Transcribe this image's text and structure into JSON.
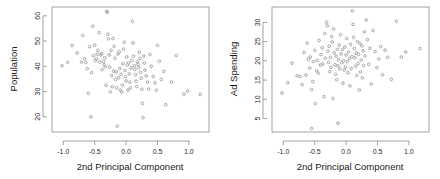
{
  "figure": {
    "width": 440,
    "height": 179,
    "background": "#ffffff",
    "point_color": "#9a9a9a",
    "axis_color": "#8a8a8a",
    "text_color": "#1a1a1a"
  },
  "chart_data": [
    {
      "type": "scatter",
      "title": "",
      "xlabel": "2nd Principal Component",
      "ylabel": "Population",
      "xlim": [
        -1.18,
        1.32
      ],
      "ylim": [
        14.0,
        63.5
      ],
      "xticks": [
        -1.0,
        -0.5,
        0.0,
        0.5,
        1.0
      ],
      "xticklabels": [
        "-1.0",
        "-0.5",
        "0.0",
        "0.5",
        "1.0"
      ],
      "yticks": [
        20,
        30,
        40,
        50,
        60
      ],
      "yticklabels": [
        "20",
        "30",
        "40",
        "50",
        "60"
      ],
      "grid": false,
      "legend": "none",
      "marker": "open-circle",
      "x": [
        -1.02,
        -0.93,
        -0.86,
        -0.78,
        -0.71,
        -0.69,
        -0.66,
        -0.64,
        -0.62,
        -0.6,
        -0.58,
        -0.56,
        -0.55,
        -0.53,
        -0.52,
        -0.5,
        -0.49,
        -0.47,
        -0.46,
        -0.45,
        -0.43,
        -0.42,
        -0.4,
        -0.39,
        -0.38,
        -0.36,
        -0.35,
        -0.34,
        -0.33,
        -0.32,
        -0.31,
        -0.3,
        -0.29,
        -0.28,
        -0.27,
        -0.26,
        -0.25,
        -0.24,
        -0.23,
        -0.22,
        -0.21,
        -0.2,
        -0.19,
        -0.18,
        -0.17,
        -0.16,
        -0.15,
        -0.14,
        -0.13,
        -0.12,
        -0.11,
        -0.1,
        -0.09,
        -0.08,
        -0.07,
        -0.06,
        -0.05,
        -0.04,
        -0.03,
        -0.02,
        -0.01,
        0.0,
        0.01,
        0.02,
        0.03,
        0.04,
        0.05,
        0.06,
        0.07,
        0.08,
        0.09,
        0.1,
        0.11,
        0.12,
        0.13,
        0.14,
        0.15,
        0.16,
        0.17,
        0.18,
        0.19,
        0.2,
        0.21,
        0.22,
        0.23,
        0.24,
        0.25,
        0.26,
        0.27,
        0.28,
        0.29,
        0.3,
        0.32,
        0.34,
        0.36,
        0.38,
        0.4,
        0.43,
        0.46,
        0.48,
        0.5,
        0.53,
        0.56,
        0.6,
        0.63,
        0.72,
        0.8,
        0.92,
        0.98,
        1.18
      ],
      "y": [
        40.2,
        41.6,
        48.3,
        45.3,
        41.7,
        52.2,
        43.0,
        41.5,
        39.1,
        29.3,
        47.8,
        20.0,
        37.5,
        55.9,
        44.2,
        48.4,
        42.3,
        43.0,
        44.8,
        46.3,
        53.3,
        41.7,
        44.5,
        45.1,
        38.7,
        42.0,
        40.7,
        43.4,
        39.8,
        32.5,
        61.8,
        61.4,
        52.7,
        50.9,
        44.5,
        39.6,
        29.9,
        46.3,
        36.3,
        31.9,
        51.0,
        38.1,
        47.9,
        43.2,
        34.8,
        37.8,
        31.5,
        16.3,
        44.9,
        35.5,
        45.8,
        39.2,
        30.6,
        36.8,
        29.8,
        32.6,
        41.0,
        46.8,
        49.5,
        38.4,
        35.9,
        34.2,
        43.7,
        40.5,
        30.6,
        41.4,
        37.0,
        33.7,
        31.5,
        39.4,
        42.3,
        57.8,
        49.3,
        44.0,
        40.2,
        38.8,
        36.7,
        34.1,
        32.0,
        41.8,
        40.8,
        39.6,
        45.6,
        43.1,
        37.6,
        35.3,
        30.9,
        25.3,
        19.7,
        44.1,
        41.3,
        38.5,
        36.2,
        33.8,
        31.0,
        44.7,
        40.0,
        36.0,
        33.5,
        30.5,
        48.3,
        42.0,
        34.8,
        38.0,
        24.8,
        33.8,
        44.3,
        29.0,
        30.2,
        28.9
      ]
    },
    {
      "type": "scatter",
      "title": "",
      "xlabel": "2nd Principal Component",
      "ylabel": "Ad Spending",
      "xlim": [
        -1.18,
        1.32
      ],
      "ylim": [
        1.5,
        34.0
      ],
      "xticks": [
        -1.0,
        -0.5,
        0.0,
        0.5,
        1.0
      ],
      "xticklabels": [
        "-1.0",
        "-0.5",
        "0.0",
        "0.5",
        "1.0"
      ],
      "yticks": [
        5,
        10,
        15,
        20,
        25,
        30
      ],
      "yticklabels": [
        "5",
        "10",
        "15",
        "20",
        "25",
        "30"
      ],
      "grid": false,
      "legend": "none",
      "marker": "open-circle",
      "x": [
        -1.02,
        -0.93,
        -0.86,
        -0.78,
        -0.73,
        -0.7,
        -0.67,
        -0.64,
        -0.62,
        -0.6,
        -0.58,
        -0.57,
        -0.55,
        -0.53,
        -0.52,
        -0.5,
        -0.49,
        -0.47,
        -0.46,
        -0.44,
        -0.43,
        -0.41,
        -0.4,
        -0.38,
        -0.37,
        -0.35,
        -0.34,
        -0.33,
        -0.31,
        -0.3,
        -0.29,
        -0.28,
        -0.27,
        -0.26,
        -0.25,
        -0.24,
        -0.23,
        -0.22,
        -0.21,
        -0.2,
        -0.19,
        -0.18,
        -0.17,
        -0.16,
        -0.15,
        -0.14,
        -0.13,
        -0.12,
        -0.11,
        -0.1,
        -0.09,
        -0.08,
        -0.07,
        -0.06,
        -0.05,
        -0.04,
        -0.03,
        -0.02,
        -0.01,
        0.0,
        0.01,
        0.02,
        0.03,
        0.04,
        0.05,
        0.06,
        0.07,
        0.08,
        0.09,
        0.1,
        0.11,
        0.12,
        0.13,
        0.14,
        0.15,
        0.16,
        0.17,
        0.18,
        0.19,
        0.2,
        0.21,
        0.22,
        0.23,
        0.24,
        0.25,
        0.26,
        0.27,
        0.28,
        0.29,
        0.3,
        0.32,
        0.34,
        0.36,
        0.38,
        0.4,
        0.43,
        0.46,
        0.49,
        0.52,
        0.55,
        0.58,
        0.62,
        0.66,
        0.72,
        0.8,
        0.88,
        0.95,
        1.18,
        -0.55,
        -0.13
      ],
      "y": [
        11.6,
        14.3,
        19.4,
        16.1,
        15.9,
        13.8,
        22.2,
        16.3,
        24.6,
        20.4,
        18.1,
        21.0,
        12.5,
        14.6,
        19.8,
        22.7,
        8.9,
        17.4,
        20.1,
        16.8,
        25.3,
        18.9,
        21.6,
        23.4,
        19.2,
        10.7,
        27.1,
        20.7,
        30.0,
        29.1,
        22.5,
        19.6,
        23.8,
        17.2,
        20.9,
        18.3,
        26.3,
        24.9,
        10.2,
        28.3,
        22.1,
        19.0,
        16.5,
        21.2,
        15.1,
        23.0,
        18.7,
        20.3,
        24.1,
        17.9,
        26.8,
        21.8,
        19.5,
        22.9,
        14.2,
        20.0,
        17.6,
        23.6,
        18.4,
        21.5,
        25.8,
        19.8,
        16.9,
        22.3,
        20.6,
        13.5,
        24.3,
        18.0,
        21.1,
        33.0,
        29.5,
        26.1,
        23.2,
        20.8,
        18.6,
        22.0,
        16.2,
        25.0,
        19.3,
        21.7,
        12.4,
        24.5,
        17.1,
        20.2,
        23.9,
        15.6,
        22.6,
        18.8,
        27.5,
        21.3,
        30.6,
        25.5,
        19.1,
        23.3,
        14.0,
        27.9,
        22.4,
        18.2,
        20.5,
        23.7,
        16.4,
        22.8,
        20.9,
        15.2,
        30.3,
        21.0,
        22.3,
        23.2,
        2.4,
        3.8
      ]
    }
  ]
}
